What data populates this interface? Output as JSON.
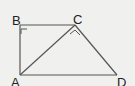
{
  "diagram": {
    "type": "geometry",
    "points": {
      "A": {
        "label": "A",
        "x": 20,
        "y": 75
      },
      "B": {
        "label": "B",
        "x": 20,
        "y": 25
      },
      "C": {
        "label": "C",
        "x": 75,
        "y": 25
      },
      "D": {
        "label": "D",
        "x": 117,
        "y": 75
      }
    },
    "segments": [
      "AB",
      "BC",
      "CD",
      "DA",
      "AC"
    ],
    "right_angles": [
      "ABC",
      "ACD"
    ],
    "stroke_color": "#555555",
    "background": "#f0f0ee"
  }
}
